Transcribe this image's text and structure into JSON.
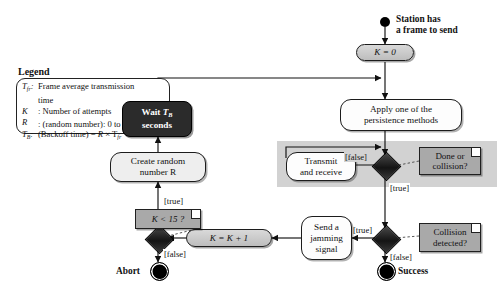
{
  "diagram": {
    "legend": {
      "heading": "Legend",
      "entries": [
        {
          "key": "T_fr",
          "key_html": "Tfr",
          "desc": "Frame average transmission",
          "desc_cont": "time"
        },
        {
          "key": "K",
          "key_html": "K",
          "desc": ": Number of attempts",
          "desc_cont": ""
        },
        {
          "key": "R",
          "key_html": "R",
          "desc": ": (random number): 0 to 2K − 1",
          "desc_cont": ""
        },
        {
          "key": "T_B",
          "key_html": "TB",
          "desc": ": (Backoff time) = R × Tfr",
          "desc_cont": ""
        }
      ]
    },
    "nodes": {
      "start_caption_line1": "Station has",
      "start_caption_line2": "a frame to send",
      "k_init": "K = 0",
      "persistence_line1": "Apply one of the",
      "persistence_line2": "persistence methods",
      "transmit_line1": "Transmit",
      "transmit_line2": "and receive",
      "jamming_line1": "Send a",
      "jamming_line2": "jamming",
      "jamming_line3": "signal",
      "k_increment": "K = K + 1",
      "create_random_line1": "Create random",
      "create_random_line2": "number R",
      "wait_line1": "Wait TB",
      "wait_line2": "seconds",
      "abort_label": "Abort",
      "success_label": "Success"
    },
    "notes": {
      "done_or_collision_line1": "Done or",
      "done_or_collision_line2": "collision?",
      "collision_detected_line1": "Collision",
      "collision_detected_line2": "detected?",
      "k_less_than_15": "K < 15 ?"
    },
    "guards": {
      "done_false": "[false]",
      "done_true": "[true]",
      "collision_true": "[true]",
      "collision_false": "[false]",
      "k15_true": "[true]",
      "k15_false": "[false]"
    },
    "colors": {
      "band": "#d2d2d2",
      "note": "#a9a9a9",
      "pill": "#cccccc",
      "dark_node": "#2b2b2b",
      "stroke": "#1c1c1c"
    }
  }
}
